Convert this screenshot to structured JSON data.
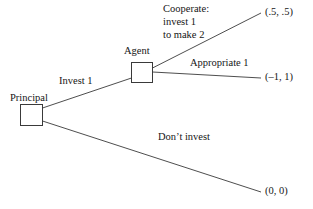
{
  "diagram": {
    "type": "extensive-form-game-tree",
    "background_color": "#ffffff",
    "line_color": "#3a3a3a",
    "text_color": "#161616",
    "nodes": [
      {
        "id": "principal",
        "label": "Principal"
      },
      {
        "id": "agent",
        "label": "Agent"
      }
    ],
    "branch_labels": {
      "invest": "Invest 1",
      "dont_invest": "Don’t invest",
      "cooperate": "Cooperate:\ninvest 1\nto make 2",
      "appropriate": "Appropriate 1"
    },
    "payoffs": {
      "cooperate": "(.5, .5)",
      "appropriate": "(–1, 1)",
      "dont_invest": "(0, 0)"
    }
  }
}
